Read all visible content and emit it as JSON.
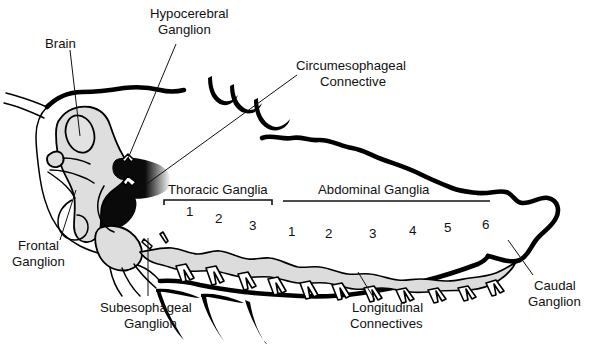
{
  "figure": {
    "background_color": "#ffffff",
    "ink_color": "#111111",
    "cord_fill_color": "#dcdcdc",
    "head_fill_color": "#dedede"
  },
  "labels": {
    "brain": "Brain",
    "hypocerebral_ganglion": "Hypocerebral\nGanglion",
    "hypocerebral_line1": "Hypocerebral",
    "hypocerebral_line2": "Ganglion",
    "circumesophageal_line1": "Circumesophageal",
    "circumesophageal_line2": "Connective",
    "frontal_line1": "Frontal",
    "frontal_line2": "Ganglion",
    "subesophageal_line1": "Subesophageal",
    "subesophageal_line2": "Ganglion",
    "longitudinal_line1": "Longitudinal",
    "longitudinal_line2": "Connectives",
    "caudal_line1": "Caudal",
    "caudal_line2": "Ganglion"
  },
  "groups": {
    "thoracic": {
      "label": "Thoracic Ganglia",
      "segment_numbers": [
        "1",
        "2",
        "3"
      ]
    },
    "abdominal": {
      "label": "Abdominal Ganglia",
      "segment_numbers": [
        "1",
        "2",
        "3",
        "4",
        "5",
        "6"
      ]
    }
  },
  "thoracic_numbers": {
    "n1": "1",
    "n2": "2",
    "n3": "3"
  },
  "abdominal_numbers": {
    "a1": "1",
    "a2": "2",
    "a3": "3",
    "a4": "4",
    "a5": "5",
    "a6": "6"
  }
}
